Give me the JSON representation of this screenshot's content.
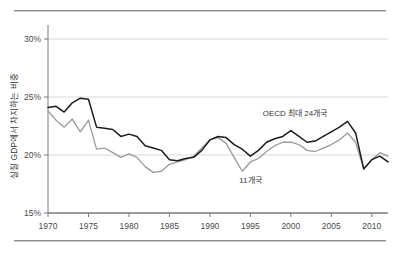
{
  "chart_data": {
    "type": "line",
    "title": "",
    "subtitle": "",
    "xlabel": "",
    "ylabel": "실질 GDP에서 차지하는 비중",
    "xlim": [
      1970,
      2012
    ],
    "ylim": [
      15,
      30
    ],
    "ytick_labels": [
      "30%",
      "25%",
      "20%",
      "15%"
    ],
    "ytick_values": [
      30,
      25,
      20,
      15
    ],
    "xtick_labels": [
      "1970",
      "1975",
      "1980",
      "1985",
      "1990",
      "1995",
      "2000",
      "2005",
      "2010"
    ],
    "xtick_values": [
      1970,
      1975,
      1980,
      1985,
      1990,
      1995,
      2000,
      2005,
      2010
    ],
    "grid": "horizontal",
    "legend_position": "inline-annotation",
    "annotations": [
      {
        "text": "OECD 최대 24개국",
        "x": 2000.5,
        "y": 23.4
      },
      {
        "text": "11개국",
        "x": 1995.0,
        "y": 17.6
      }
    ],
    "x": [
      1970,
      1971,
      1972,
      1973,
      1974,
      1975,
      1976,
      1977,
      1978,
      1979,
      1980,
      1981,
      1982,
      1983,
      1984,
      1985,
      1986,
      1987,
      1988,
      1989,
      1990,
      1991,
      1992,
      1993,
      1994,
      1995,
      1996,
      1997,
      1998,
      1999,
      2000,
      2001,
      2002,
      2003,
      2004,
      2005,
      2006,
      2007,
      2008,
      2009,
      2010,
      2011,
      2012
    ],
    "series": [
      {
        "name": "OECD 최대 24개국",
        "color": "#1c1c1c",
        "values": [
          24.1,
          24.2,
          23.7,
          24.5,
          24.9,
          24.8,
          22.4,
          22.3,
          22.2,
          21.6,
          21.8,
          21.6,
          20.8,
          20.6,
          20.4,
          19.6,
          19.5,
          19.7,
          19.8,
          20.4,
          21.3,
          21.6,
          21.5,
          20.9,
          20.5,
          19.9,
          20.4,
          21.1,
          21.4,
          21.6,
          22.1,
          21.6,
          21.1,
          21.2,
          21.6,
          22.0,
          22.4,
          22.9,
          21.9,
          18.8,
          19.6,
          19.9,
          19.4
        ]
      },
      {
        "name": "11개국",
        "color": "#9a9a9a",
        "values": [
          23.8,
          23.0,
          22.4,
          23.1,
          22.0,
          23.0,
          20.5,
          20.6,
          20.2,
          19.8,
          20.1,
          19.8,
          19.0,
          18.5,
          18.6,
          19.2,
          19.4,
          19.6,
          19.9,
          20.6,
          21.3,
          21.5,
          21.0,
          19.8,
          18.6,
          19.4,
          19.7,
          20.3,
          20.8,
          21.1,
          21.1,
          20.9,
          20.4,
          20.3,
          20.6,
          20.9,
          21.3,
          21.9,
          21.1,
          18.8,
          19.6,
          20.2,
          19.9
        ]
      }
    ]
  }
}
